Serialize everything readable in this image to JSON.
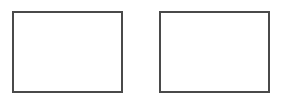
{
  "diagram": {
    "background": "#ffffff",
    "stroke_color": "#4a4a4a",
    "boxes": [
      {
        "id": "left",
        "label": ""
      },
      {
        "id": "right",
        "label": ""
      }
    ]
  }
}
